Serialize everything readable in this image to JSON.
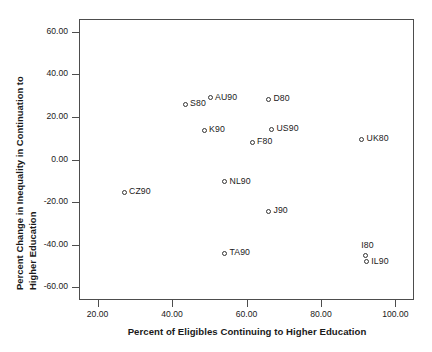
{
  "chart_data": {
    "type": "scatter",
    "title": "",
    "xlabel": "Percent of Eligibles Continuing to Higher Education",
    "ylabel_line1": "Percent Change in Inequality in Continuation to",
    "ylabel_line2": "Higher Education",
    "xlim": [
      15.0,
      105.0
    ],
    "ylim": [
      -66.0,
      66.0
    ],
    "grid": false,
    "legend": "none",
    "xticks": [
      "20.00",
      "40.00",
      "60.00",
      "80.00",
      "100.00"
    ],
    "xtick_values": [
      20,
      40,
      60,
      80,
      100
    ],
    "yticks": [
      "60.00",
      "40.00",
      "20.00",
      "0.00",
      "-20.00",
      "-40.00",
      "-60.00"
    ],
    "ytick_values": [
      60,
      40,
      20,
      0,
      -20,
      -40,
      -60
    ],
    "marker": "open-circle",
    "points": [
      {
        "label": "S80",
        "x": 43.5,
        "y": 26.0,
        "label_pos": "right"
      },
      {
        "label": "AU90",
        "x": 50.2,
        "y": 29.0,
        "label_pos": "right"
      },
      {
        "label": "D80",
        "x": 65.9,
        "y": 28.2,
        "label_pos": "right"
      },
      {
        "label": "K90",
        "x": 48.6,
        "y": 13.8,
        "label_pos": "right"
      },
      {
        "label": "US90",
        "x": 66.7,
        "y": 14.2,
        "label_pos": "right"
      },
      {
        "label": "F80",
        "x": 61.5,
        "y": 8.0,
        "label_pos": "right"
      },
      {
        "label": "UK80",
        "x": 90.9,
        "y": 9.4,
        "label_pos": "right"
      },
      {
        "label": "CZ90",
        "x": 27.1,
        "y": -15.3,
        "label_pos": "right"
      },
      {
        "label": "NL90",
        "x": 54.1,
        "y": -10.4,
        "label_pos": "right"
      },
      {
        "label": "J90",
        "x": 65.9,
        "y": -24.3,
        "label_pos": "right"
      },
      {
        "label": "TA90",
        "x": 54.1,
        "y": -44.0,
        "label_pos": "right"
      },
      {
        "label": "I80",
        "x": 91.9,
        "y": -45.1,
        "label_pos": "above"
      },
      {
        "label": "IL90",
        "x": 92.2,
        "y": -48.0,
        "label_pos": "right"
      }
    ]
  },
  "colors": {
    "frame": "#4d4d4d",
    "marker": "#333333",
    "text": "#1a1a1a",
    "background": "#ffffff"
  }
}
